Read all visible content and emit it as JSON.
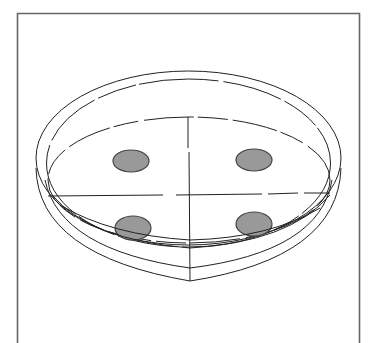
{
  "figure": {
    "colors": {
      "background": "#ffffff",
      "frame": "#666666",
      "line": "#222222",
      "spot_fill": "#999999",
      "spot_stroke": "#444444"
    },
    "frame": {
      "x": 17,
      "y": 13,
      "width": 342
    },
    "quadrant_spots": [
      {
        "position": "upper-left",
        "cx": 131,
        "cy": 161,
        "rx": 18,
        "ry": 11
      },
      {
        "position": "upper-right",
        "cx": 254,
        "cy": 160,
        "rx": 18,
        "ry": 11
      },
      {
        "position": "lower-left",
        "cx": 133,
        "cy": 228,
        "rx": 18,
        "ry": 12
      },
      {
        "position": "lower-right",
        "cx": 254,
        "cy": 224,
        "rx": 18,
        "ry": 12
      }
    ]
  }
}
